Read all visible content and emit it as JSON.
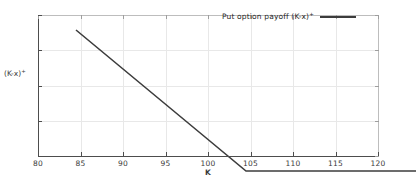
{
  "figure": {
    "background": "#ffffff",
    "line_color": "#3c3c3c",
    "grid_color": "#e8e8e8",
    "axis_color": "#4d4d4d"
  },
  "axes": {
    "x_title": "K",
    "y_title_main": "(K-x)",
    "y_title_sup": "+",
    "x_ticks": [
      "80",
      "85",
      "90",
      "95",
      "100",
      "105",
      "110",
      "115",
      "120"
    ],
    "y_ticks": [
      "0",
      "5",
      "10",
      "15",
      "20"
    ]
  },
  "legend": {
    "label_main": "Put option payoff (K-x)",
    "label_sup": "+"
  },
  "chart_data": {
    "type": "line",
    "title": "",
    "xlabel": "K",
    "ylabel": "(K-x)+",
    "xlim": [
      80,
      120
    ],
    "ylim": [
      0,
      20
    ],
    "xticks": [
      80,
      85,
      90,
      95,
      100,
      105,
      110,
      115,
      120
    ],
    "yticks": [
      0,
      5,
      10,
      15,
      20
    ],
    "grid": true,
    "legend_position": "upper right",
    "series": [
      {
        "name": "Put option payoff (K-x)+",
        "color": "#3c3c3c",
        "linewidth": 1.6,
        "x": [
          80,
          85,
          90,
          95,
          100,
          105,
          110,
          115,
          120
        ],
        "values": [
          20,
          15,
          10,
          5,
          0,
          0,
          0,
          0,
          0
        ]
      }
    ]
  }
}
